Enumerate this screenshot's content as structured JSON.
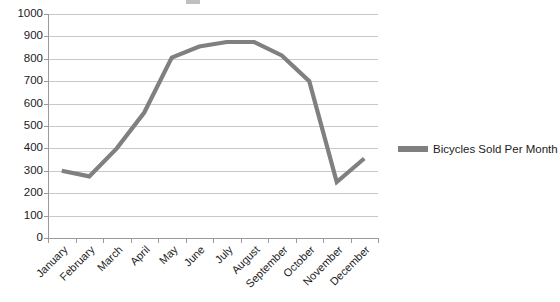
{
  "chart_data": {
    "type": "line",
    "title": "",
    "xlabel": "",
    "ylabel": "",
    "ylim": [
      0,
      1000
    ],
    "ytick_step": 100,
    "ytick_labels": [
      "1000",
      "900",
      "800",
      "700",
      "600",
      "500",
      "400",
      "300",
      "200",
      "100",
      "0"
    ],
    "grid": true,
    "legend_position": "right",
    "categories": [
      "January",
      "February",
      "March",
      "April",
      "May",
      "June",
      "July",
      "August",
      "September",
      "October",
      "November",
      "December"
    ],
    "series": [
      {
        "name": "Bicycles Sold Per Month",
        "color": "#808080",
        "values": [
          300,
          275,
          400,
          560,
          805,
          855,
          875,
          875,
          815,
          700,
          250,
          355
        ]
      }
    ]
  },
  "legend": {
    "entries": [
      {
        "label": "Bicycles Sold Per Month",
        "color": "#808080"
      }
    ]
  },
  "colors": {
    "series": "#808080",
    "gridline": "#c8c8c8",
    "axis": "#9a9a9a",
    "text": "#1b1b1b",
    "background": "#ffffff"
  }
}
